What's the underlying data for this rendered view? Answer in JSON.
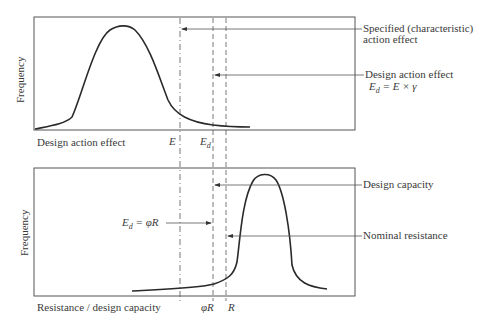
{
  "top_panel": {
    "ylabel": "Frequency",
    "xlabel": "Design action effect",
    "markers": {
      "E": "E",
      "Ed_main": "E",
      "Ed_sub": "d"
    },
    "annotations": {
      "specified_line1": "Specified (characteristic)",
      "specified_line2": "action effect",
      "design_line1": "Design action effect",
      "design_formula": "Eₔ = E × γ",
      "formula_Ed": "E",
      "formula_sub": "d",
      "formula_rest": "= E × γ"
    }
  },
  "bottom_panel": {
    "ylabel": "Frequency",
    "xlabel": "Resistance / design capacity",
    "markers": {
      "phiR": "φR",
      "R": "R"
    },
    "annotations": {
      "design_capacity": "Design capacity",
      "nominal_resistance": "Nominal resistance",
      "equation_E": "E",
      "equation_sub": "d",
      "equation_rest": "= φR"
    }
  },
  "colors": {
    "line": "#2a2a2a",
    "frame": "#555555",
    "text": "#3a3a3a"
  }
}
